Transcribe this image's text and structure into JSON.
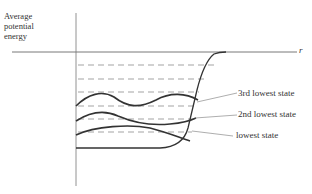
{
  "diagram": {
    "y_axis_label_lines": [
      "Average",
      "potential",
      "energy"
    ],
    "x_axis_label": "r",
    "state_labels": [
      "3rd lowest state",
      "2nd lowest state",
      "lowest state"
    ],
    "energy_levels_dashed_count": 6
  }
}
